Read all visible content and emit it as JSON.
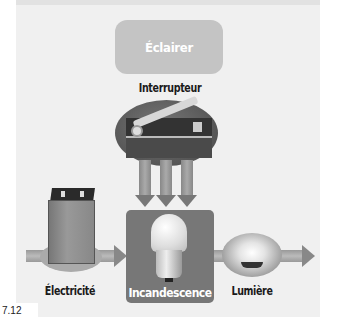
{
  "diagram": {
    "goal": {
      "label": "Éclairer"
    },
    "switch": {
      "label": "Interrupteur"
    },
    "flow": [
      {
        "label": "Électricité"
      },
      {
        "label": "Incandescence"
      },
      {
        "label": "Lumière"
      }
    ],
    "figure_number": "7.12"
  },
  "colors": {
    "panel": "#f0f0f0",
    "goal_box": "#c4c4c4",
    "process_box": "#777777",
    "arrow": "#999999",
    "text": "#1a1a1a"
  }
}
